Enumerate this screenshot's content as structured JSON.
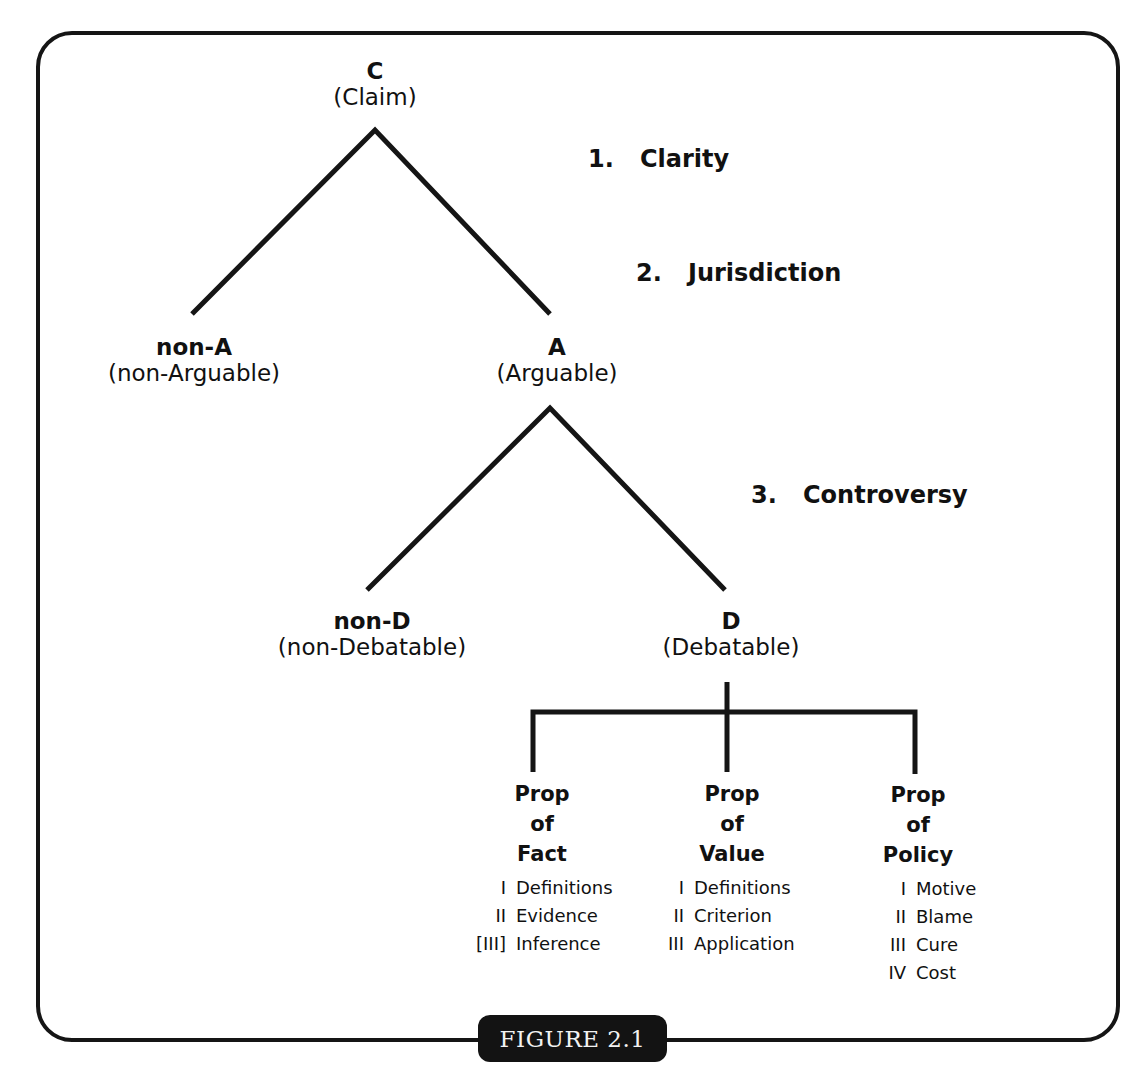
{
  "figure": {
    "label": "FIGURE 2.1",
    "colors": {
      "ink": "#151515",
      "background": "#ffffff",
      "label_text": "#f2f2f2"
    }
  },
  "tree": {
    "root": {
      "code": "C",
      "name": "(Claim)"
    },
    "level1": {
      "left": {
        "code": "non-A",
        "name": "(non-Arguable)"
      },
      "right": {
        "code": "A",
        "name": "(Arguable)"
      }
    },
    "level2": {
      "left": {
        "code": "non-D",
        "name": "(non-Debatable)"
      },
      "right": {
        "code": "D",
        "name": "(Debatable)"
      }
    }
  },
  "criteria": [
    {
      "num": "1.",
      "label": "Clarity"
    },
    {
      "num": "2.",
      "label": "Jurisdiction"
    },
    {
      "num": "3.",
      "label": "Controversy"
    }
  ],
  "propositions": [
    {
      "line1": "Prop",
      "line2": "of",
      "line3": "Fact",
      "stock_issues": [
        {
          "numeral": "I",
          "label": "Definitions"
        },
        {
          "numeral": "II",
          "label": "Evidence"
        },
        {
          "numeral": "[III]",
          "label": "Inference"
        }
      ]
    },
    {
      "line1": "Prop",
      "line2": "of",
      "line3": "Value",
      "stock_issues": [
        {
          "numeral": "I",
          "label": "Definitions"
        },
        {
          "numeral": "II",
          "label": "Criterion"
        },
        {
          "numeral": "III",
          "label": "Application"
        }
      ]
    },
    {
      "line1": "Prop",
      "line2": "of",
      "line3": "Policy",
      "stock_issues": [
        {
          "numeral": "I",
          "label": "Motive"
        },
        {
          "numeral": "II",
          "label": "Blame"
        },
        {
          "numeral": "III",
          "label": "Cure"
        },
        {
          "numeral": "IV",
          "label": "Cost"
        }
      ]
    }
  ]
}
